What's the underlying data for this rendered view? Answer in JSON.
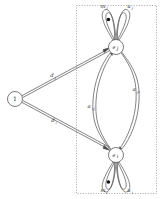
{
  "figure": {
    "type": "petri-net-graph",
    "background_color": "#ffffff",
    "stroke_color": "#4a4a4a",
    "text_color": "#1a1a1a",
    "boundary": {
      "style": "dotted",
      "x": 76,
      "y": 5,
      "width": 81,
      "height": 189
    }
  },
  "nodes": [
    {
      "id": "source",
      "label": "1",
      "italic": false,
      "cx": 15,
      "cy": 99,
      "r": 7.5
    },
    {
      "id": "ej",
      "label": "e",
      "subscript": "j",
      "italic": true,
      "cx": 116,
      "cy": 47,
      "r": 7.5
    },
    {
      "id": "ei",
      "label": "e",
      "subscript": "i",
      "italic": true,
      "cx": 116,
      "cy": 155,
      "r": 7.5
    }
  ],
  "edges": [
    {
      "id": "source-to-ej",
      "label": "d",
      "subscript": "j",
      "from": "source",
      "to": "ej",
      "label_x": 52,
      "label_y": 77
    },
    {
      "id": "source-to-ei",
      "label": "d",
      "subscript": "i",
      "from": "source",
      "to": "ei",
      "label_x": 53,
      "label_y": 122
    },
    {
      "id": "ei-to-ej",
      "label": "a",
      "subscript": "ij",
      "from": "ei",
      "to": "ej",
      "label_x": 91,
      "label_y": 108
    },
    {
      "id": "ej-to-ei",
      "label": "a",
      "subscript": "ji",
      "from": "ej",
      "to": "ei",
      "label_x": 136,
      "label_y": 91
    }
  ],
  "self_loops": [
    {
      "id": "loop-mj",
      "node": "ej",
      "label": "m",
      "subscript": "j",
      "token": true,
      "label_x": 103,
      "label_y": 6
    },
    {
      "id": "loop-uj",
      "node": "ej",
      "label": "u",
      "subscript": "j",
      "token": false,
      "label_x": 130,
      "label_y": 6
    },
    {
      "id": "loop-mi",
      "node": "ei",
      "label": "m",
      "subscript": "i",
      "token": true,
      "label_x": 103,
      "label_y": 192
    },
    {
      "id": "loop-ui",
      "node": "ei",
      "label": "u",
      "subscript": "i",
      "token": false,
      "label_x": 130,
      "label_y": 192
    }
  ]
}
